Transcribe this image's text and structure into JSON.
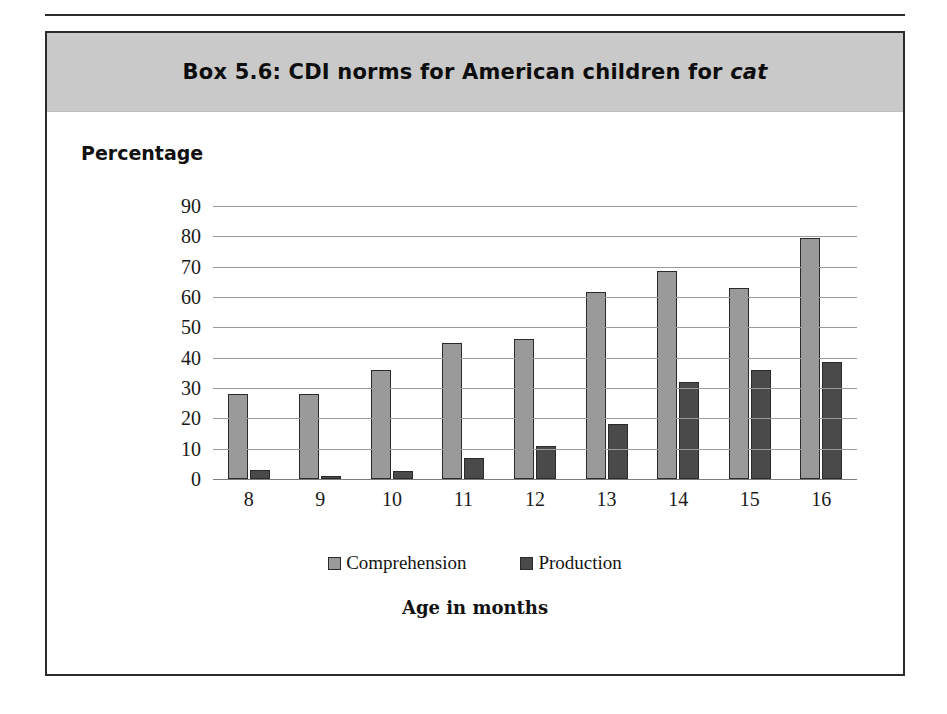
{
  "page": {
    "rule_present": true,
    "background_color": "#ffffff"
  },
  "box": {
    "header": {
      "background_color": "#c9c9c9",
      "title_prefix": "Box 5.6:  CDI norms for American children for ",
      "title_italic_word": "cat",
      "title_full": "Box 5.6:  CDI norms for American children for cat"
    },
    "border_color": "#2b2b2b"
  },
  "figure": {
    "percentage_label": "Percentage",
    "x_axis_title": "Age in months"
  },
  "chart_data": {
    "type": "bar",
    "title": "Box 5.6:  CDI norms for American children for cat",
    "xlabel": "Age in months",
    "ylabel": "Percentage",
    "ylim": [
      0,
      90
    ],
    "ytick_step": 10,
    "yticks": [
      90,
      80,
      70,
      60,
      50,
      40,
      30,
      20,
      10,
      0
    ],
    "grid": true,
    "legend_position": "bottom",
    "categories": [
      "8",
      "9",
      "10",
      "11",
      "12",
      "13",
      "14",
      "15",
      "16"
    ],
    "series": [
      {
        "name": "Comprehension",
        "color": "#9a9a9a",
        "values": [
          28,
          28,
          36,
          45,
          46,
          61.5,
          68.5,
          63,
          79.5
        ]
      },
      {
        "name": "Production",
        "color": "#4a4a4a",
        "values": [
          3,
          1,
          2.5,
          7,
          11,
          18,
          32,
          36,
          38.5
        ]
      }
    ]
  }
}
